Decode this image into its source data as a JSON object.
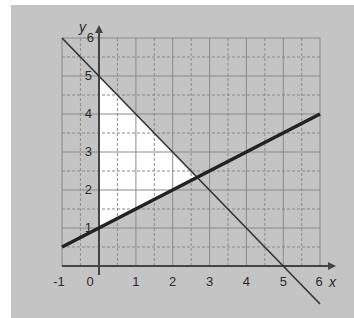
{
  "diagram": {
    "type": "linear-inequality-graph",
    "axes": {
      "x_label": "x",
      "y_label": "y",
      "x_range": [
        -1,
        6
      ],
      "y_range": [
        0,
        6
      ],
      "x_ticks": [
        "-1",
        "0",
        "1",
        "2",
        "3",
        "4",
        "5",
        "6"
      ],
      "y_ticks": [
        "1",
        "2",
        "3",
        "4",
        "5",
        "6"
      ],
      "grid_step": 0.5
    },
    "lines": [
      {
        "name": "y = 5 - x",
        "style": "thin",
        "from": [
          -1,
          6
        ],
        "to": [
          6,
          -1
        ]
      },
      {
        "name": "y = 1 + x/2",
        "style": "thick",
        "from": [
          -1,
          0.5
        ],
        "to": [
          6,
          4
        ]
      }
    ],
    "shaded_region": {
      "description": "unshaded (white) feasible triangle",
      "vertices": [
        [
          0,
          1
        ],
        [
          0,
          5
        ],
        [
          2.667,
          2.333
        ]
      ]
    },
    "colors": {
      "background": "#c4c4c4",
      "region": "#ffffff",
      "grid": "#8a8a8a",
      "axis": "#444444",
      "line": "#2a2a2a"
    }
  }
}
